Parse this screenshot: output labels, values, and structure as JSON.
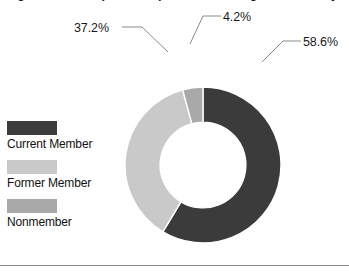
{
  "title": "Figure 3. Participation in professional organizations by membership status",
  "colors": {
    "current_member": "#3b3b3b",
    "former_member": "#c9c9c9",
    "nonmember": "#a9a9a9",
    "text": "#1a1a1a",
    "leader_line": "#8a8a8a",
    "rule": "#8a8a8a",
    "background": "#ffffff"
  },
  "legend": {
    "items": [
      {
        "label": "Current Member",
        "color": "#3b3b3b",
        "swatch_name": "legend-swatch-current-member"
      },
      {
        "label": "Former Member",
        "color": "#c9c9c9",
        "swatch_name": "legend-swatch-former-member"
      },
      {
        "label": "Nonmember",
        "color": "#a9a9a9",
        "swatch_name": "legend-swatch-nonmember"
      }
    ]
  },
  "labels": {
    "current_member_pct": "58.6%",
    "former_member_pct": "37.2%",
    "nonmember_pct": "4.2%"
  },
  "chart_data": {
    "type": "pie",
    "variant": "donut",
    "title": "Figure 3. Participation in professional organizations by membership status",
    "categories": [
      "Current Member",
      "Former Member",
      "Nonmember"
    ],
    "values": [
      58.6,
      37.2,
      4.2
    ],
    "value_labels": [
      "58.6%",
      "37.2%",
      "4.2%"
    ],
    "units": "percent",
    "total": 100.0,
    "colors": [
      "#3b3b3b",
      "#c9c9c9",
      "#a9a9a9"
    ],
    "start_angle_deg": 0,
    "direction": "clockwise",
    "inner_radius_ratio": 0.55,
    "legend": {
      "position": "left",
      "entries": [
        "Current Member",
        "Former Member",
        "Nonmember"
      ]
    },
    "labels_outside": true,
    "leader_lines": true,
    "grid": false,
    "xlabel": "",
    "ylabel": ""
  }
}
